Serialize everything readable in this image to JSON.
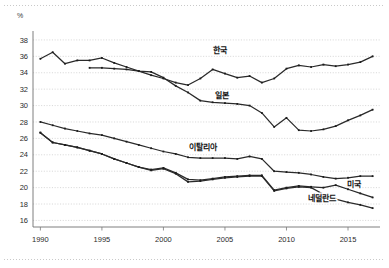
{
  "unit_label": "%",
  "chart_data": {
    "type": "line",
    "title": "",
    "subtitle": "",
    "xlabel": "",
    "ylabel": "%",
    "grid": true,
    "legend_position": "inline-labels",
    "xlim": [
      1989.4,
      2017.6
    ],
    "ylim": [
      15.2,
      38.6
    ],
    "yticks": [
      16,
      18,
      20,
      22,
      24,
      26,
      28,
      30,
      32,
      34,
      36,
      38
    ],
    "xticks": [
      1990,
      1995,
      2000,
      2005,
      2010,
      2015
    ],
    "xtick_labels": [
      "1990",
      "1995",
      "2000",
      "2005",
      "2010",
      "2015"
    ],
    "ytick_labels": [
      "16",
      "18",
      "20",
      "22",
      "24",
      "26",
      "28",
      "30",
      "32",
      "34",
      "36",
      "38"
    ],
    "series": [
      {
        "name": "한국",
        "label": "한국",
        "label_x": 2004.6,
        "label_y": 36.4,
        "x": [
          1990,
          1991,
          1992,
          1993,
          1994,
          1995,
          1996,
          1997,
          1998,
          1999,
          2000,
          2001,
          2002,
          2003,
          2004,
          2005,
          2006,
          2007,
          2008,
          2009,
          2010,
          2011,
          2012,
          2013,
          2014,
          2015,
          2016,
          2017
        ],
        "values": [
          35.7,
          36.5,
          35.1,
          35.5,
          35.5,
          35.8,
          35.2,
          34.7,
          34.2,
          33.7,
          33.3,
          32.8,
          32.5,
          33.3,
          34.4,
          33.9,
          33.4,
          33.6,
          32.8,
          33.3,
          34.5,
          34.9,
          34.7,
          35.0,
          34.8,
          35.0,
          35.3,
          36.0
        ]
      },
      {
        "name": "일본",
        "label": "일본",
        "label_x": 2004.8,
        "label_y": 30.9,
        "x": [
          1994,
          1995,
          1996,
          1997,
          1998,
          1999,
          2000,
          2001,
          2002,
          2003,
          2004,
          2005,
          2006,
          2007,
          2008,
          2009,
          2010,
          2011,
          2012,
          2013,
          2014,
          2015,
          2016,
          2017
        ],
        "values": [
          34.6,
          34.6,
          34.5,
          34.4,
          34.2,
          34.1,
          33.4,
          32.4,
          31.6,
          30.6,
          30.4,
          30.3,
          30.2,
          30.0,
          29.1,
          27.4,
          28.5,
          27.0,
          26.9,
          27.1,
          27.5,
          28.2,
          28.8,
          29.5
        ]
      },
      {
        "name": "이탈리아",
        "label": "이탈리아",
        "label_x": 2003.2,
        "label_y": 24.6,
        "x": [
          1990,
          1991,
          1992,
          1993,
          1994,
          1995,
          1996,
          1997,
          1998,
          1999,
          2000,
          2001,
          2002,
          2003,
          2004,
          2005,
          2006,
          2007,
          2008,
          2009,
          2010,
          2011,
          2012,
          2013,
          2014,
          2015,
          2016,
          2017
        ],
        "values": [
          28.0,
          27.6,
          27.2,
          26.9,
          26.6,
          26.4,
          26.0,
          25.6,
          25.2,
          24.8,
          24.4,
          24.1,
          23.7,
          23.6,
          23.6,
          23.6,
          23.5,
          23.8,
          23.5,
          22.0,
          21.9,
          21.8,
          21.6,
          21.3,
          21.1,
          21.2,
          21.4,
          21.4
        ]
      },
      {
        "name": "미국",
        "label": "미국",
        "label_x": 2015.5,
        "label_y": 20.1,
        "x": [
          1990,
          1991,
          1992,
          1993,
          1994,
          1995,
          1996,
          1997,
          1998,
          1999,
          2000,
          2001,
          2002,
          2003,
          2004,
          2005,
          2006,
          2007,
          2008,
          2009,
          2010,
          2011,
          2012,
          2013,
          2014,
          2015,
          2016,
          2017
        ],
        "values": [
          26.7,
          25.5,
          25.2,
          24.9,
          24.5,
          24.1,
          23.5,
          23.0,
          22.5,
          22.2,
          22.4,
          21.8,
          21.0,
          20.9,
          21.1,
          21.3,
          21.4,
          21.5,
          21.5,
          19.7,
          20.0,
          20.2,
          20.1,
          20.0,
          20.3,
          19.8,
          19.3,
          18.8
        ]
      },
      {
        "name": "네덜란드",
        "label": "네덜란드",
        "label_x": 2012.9,
        "label_y": 18.4,
        "x": [
          1990,
          1991,
          1992,
          1993,
          1994,
          1995,
          1996,
          1997,
          1998,
          1999,
          2000,
          2001,
          2002,
          2003,
          2004,
          2005,
          2006,
          2007,
          2008,
          2009,
          2010,
          2011,
          2012,
          2013,
          2014,
          2015,
          2016,
          2017
        ],
        "values": [
          26.7,
          25.5,
          25.2,
          24.9,
          24.5,
          24.1,
          23.5,
          23.0,
          22.5,
          22.1,
          22.3,
          21.7,
          20.7,
          20.8,
          21.0,
          21.2,
          21.3,
          21.4,
          21.4,
          19.6,
          19.9,
          20.1,
          20.0,
          19.2,
          18.6,
          18.2,
          17.9,
          17.5
        ]
      }
    ]
  }
}
